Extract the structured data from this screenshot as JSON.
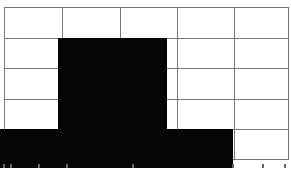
{
  "figure": {
    "grid": {
      "columns": 5,
      "rows": 5,
      "line_color": "#777777",
      "background": "#ffffff"
    },
    "fill_color": "#050505",
    "blocks": [
      {
        "name": "tall-block",
        "left": 58,
        "top": 38,
        "width": 108,
        "height": 130
      },
      {
        "name": "bottom-band",
        "left": 0,
        "top": 129,
        "width": 233,
        "height": 39
      }
    ],
    "bottom_text_clipped": true
  }
}
